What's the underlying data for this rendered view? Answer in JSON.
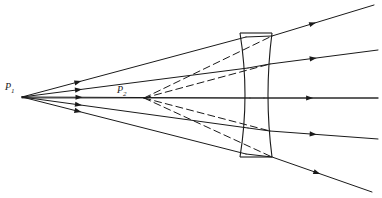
{
  "figure": {
    "name": "diverging-lens-ray-diagram",
    "background_color": "#ffffff",
    "ink_color": "#1a1a1a",
    "width": 382,
    "height": 198,
    "labels": {
      "object_point": "P",
      "object_point_subscript": "1",
      "image_point": "P",
      "image_point_subscript": "2"
    },
    "caption_remnant": "",
    "optical_axis": {
      "y": 98,
      "x_start": 22,
      "x_end": 378
    },
    "lens": {
      "type": "biconcave",
      "top_y": 33,
      "bottom_y": 157,
      "left_edge_x": 240,
      "right_edge_x": 272,
      "waist_left_x": 250,
      "waist_right_x": 264,
      "stroke_width": 1.1
    },
    "points": {
      "P1": {
        "x": 22,
        "y": 97
      },
      "P2": {
        "x": 144,
        "y": 98
      }
    },
    "incident_rays": [
      {
        "id": "incident-ray-1",
        "x1": 22,
        "y1": 97,
        "x2": 246,
        "y2": 37,
        "arrow_t": 0.25
      },
      {
        "id": "incident-ray-2",
        "x1": 22,
        "y1": 97,
        "x2": 248,
        "y2": 68,
        "arrow_t": 0.25
      },
      {
        "id": "incident-ray-3",
        "x1": 22,
        "y1": 97,
        "x2": 250,
        "y2": 98,
        "arrow_t": 0.25
      },
      {
        "id": "incident-ray-4",
        "x1": 22,
        "y1": 97,
        "x2": 248,
        "y2": 128,
        "arrow_t": 0.25
      },
      {
        "id": "incident-ray-5",
        "x1": 22,
        "y1": 97,
        "x2": 246,
        "y2": 154,
        "arrow_t": 0.25
      }
    ],
    "lens_internal_rays": [
      {
        "id": "internal-ray-1",
        "x1": 246,
        "y1": 37,
        "x2": 272,
        "y2": 36
      },
      {
        "id": "internal-ray-2",
        "x1": 248,
        "y1": 68,
        "x2": 270,
        "y2": 64
      },
      {
        "id": "internal-ray-3",
        "x1": 250,
        "y1": 98,
        "x2": 264,
        "y2": 98
      },
      {
        "id": "internal-ray-4",
        "x1": 248,
        "y1": 128,
        "x2": 270,
        "y2": 131
      },
      {
        "id": "internal-ray-5",
        "x1": 246,
        "y1": 154,
        "x2": 272,
        "y2": 157
      }
    ],
    "refracted_rays": [
      {
        "id": "refracted-ray-1",
        "x1": 272,
        "y1": 36,
        "x2": 374,
        "y2": 5,
        "arrow_t": 0.4
      },
      {
        "id": "refracted-ray-2",
        "x1": 270,
        "y1": 64,
        "x2": 378,
        "y2": 50,
        "arrow_t": 0.4
      },
      {
        "id": "refracted-ray-3",
        "x1": 264,
        "y1": 98,
        "x2": 378,
        "y2": 98,
        "arrow_t": 0.4
      },
      {
        "id": "refracted-ray-4",
        "x1": 270,
        "y1": 131,
        "x2": 378,
        "y2": 139,
        "arrow_t": 0.4
      },
      {
        "id": "refracted-ray-5",
        "x1": 272,
        "y1": 157,
        "x2": 372,
        "y2": 192,
        "arrow_t": 0.45
      }
    ],
    "virtual_rays": [
      {
        "id": "virtual-ray-1",
        "x1": 144,
        "y1": 98,
        "x2": 272,
        "y2": 36
      },
      {
        "id": "virtual-ray-2",
        "x1": 144,
        "y1": 98,
        "x2": 270,
        "y2": 64
      },
      {
        "id": "virtual-ray-4",
        "x1": 144,
        "y1": 98,
        "x2": 270,
        "y2": 131
      },
      {
        "id": "virtual-ray-5",
        "x1": 144,
        "y1": 98,
        "x2": 272,
        "y2": 157
      }
    ],
    "virtual_dash_pattern": "7 4",
    "arrow_size": {
      "length": 7,
      "half_width": 2.6
    }
  }
}
